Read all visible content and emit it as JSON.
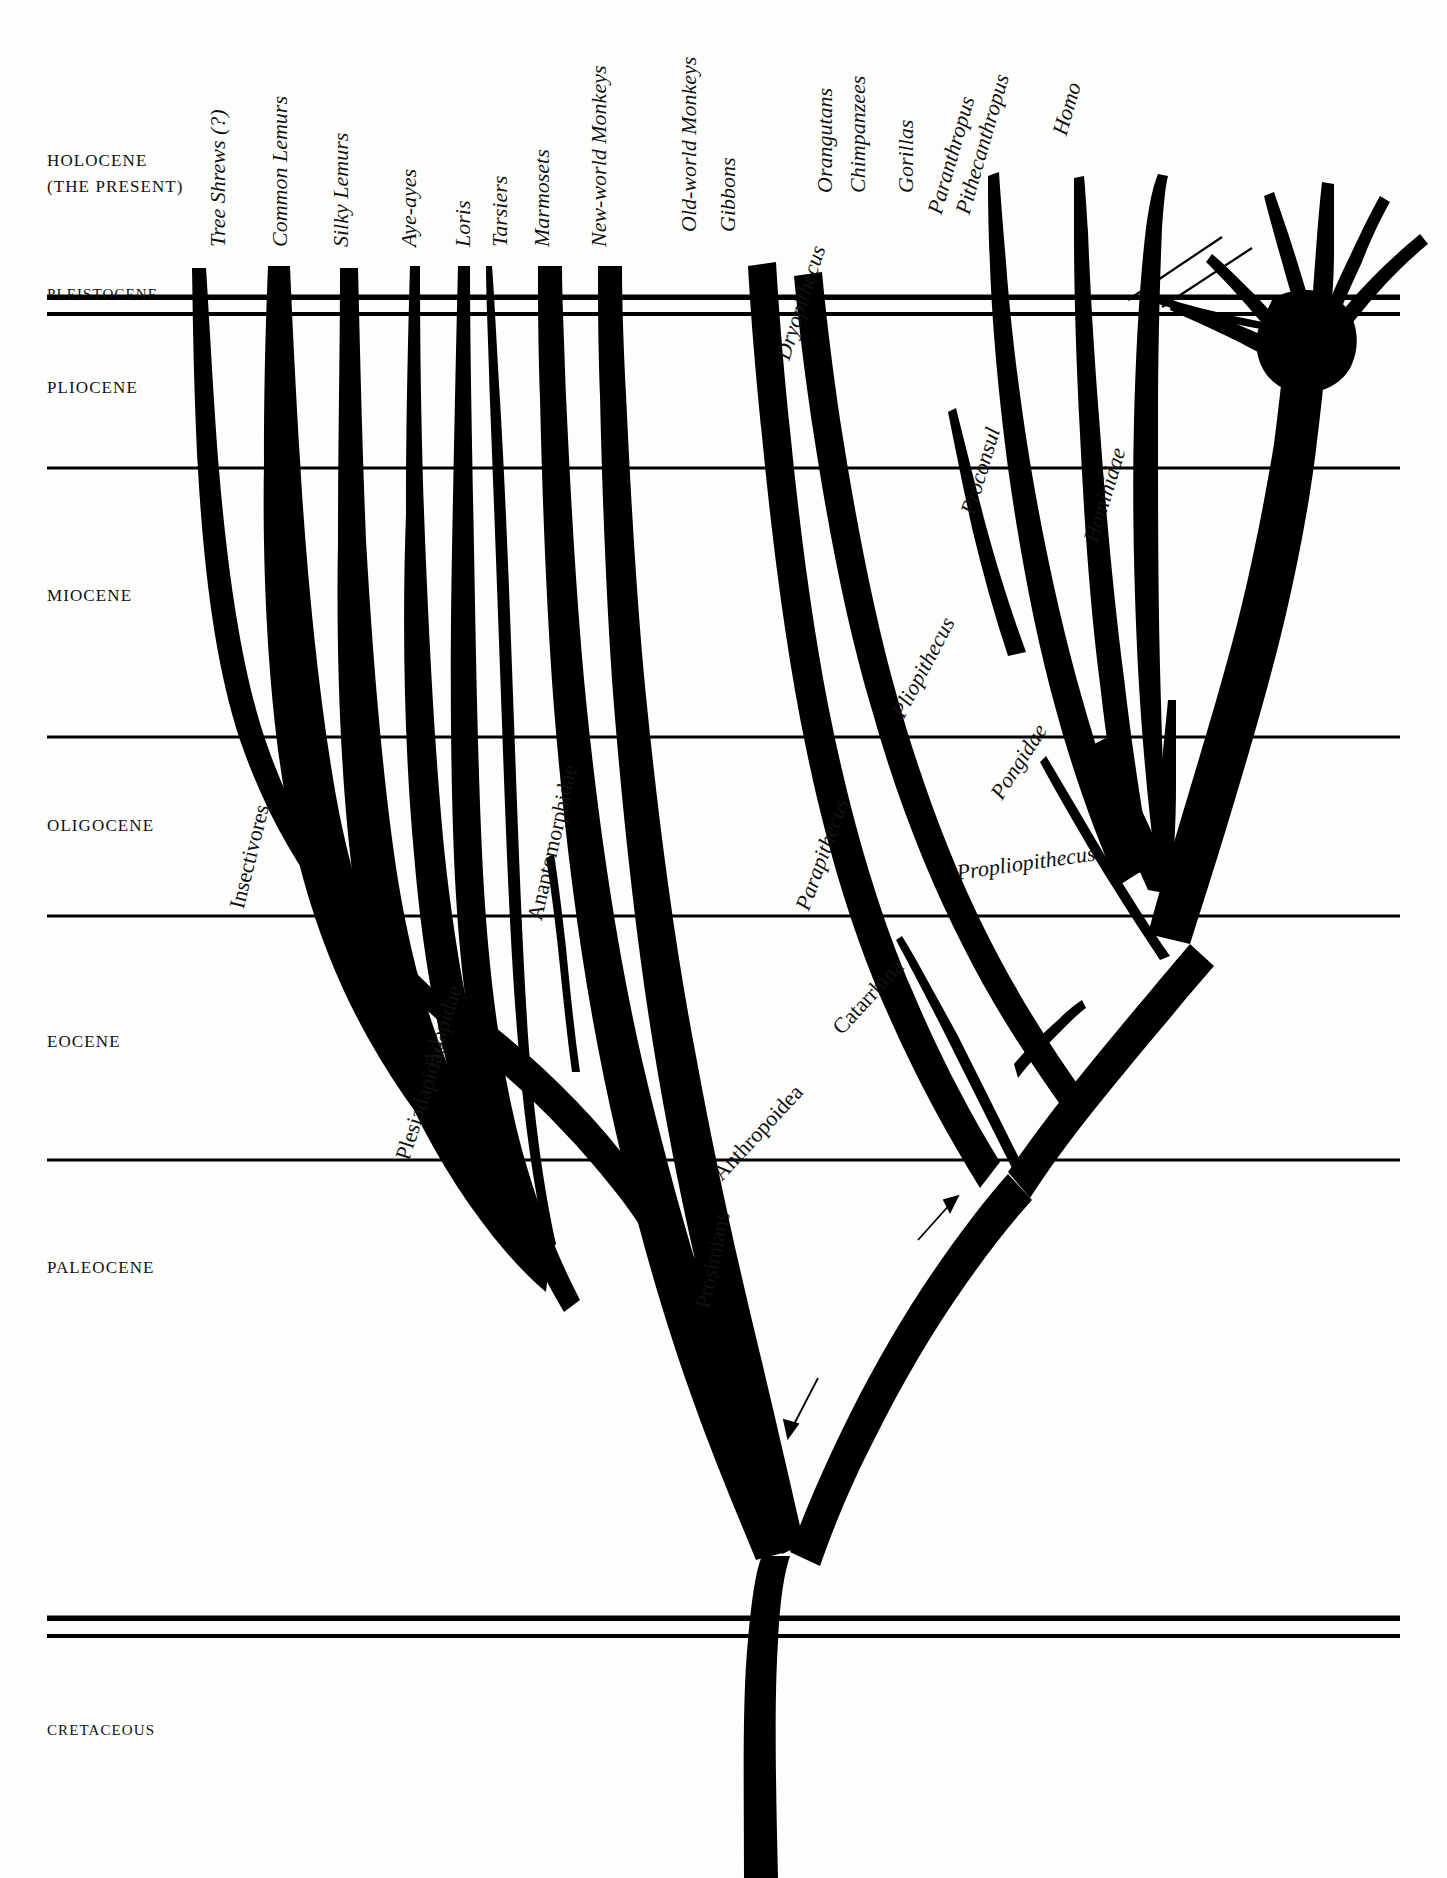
{
  "figure": {
    "kind": "primate-phylogeny-tree",
    "background_color": "#fdfdfc",
    "ink_color": "#000000"
  },
  "time_axis": {
    "epochs": [
      {
        "id": "holocene",
        "label_line1": "HOLOCENE",
        "label_line2": "(THE PRESENT)",
        "label_x": 47,
        "label_y": 155
      },
      {
        "id": "pleistocene",
        "label_line1": "PLEISTOCENE",
        "label_line2": "",
        "label_x": 47,
        "label_y": 286
      },
      {
        "id": "pliocene",
        "label_line1": "PLIOCENE",
        "label_line2": "",
        "label_x": 47,
        "label_y": 378
      },
      {
        "id": "miocene",
        "label_line1": "MIOCENE",
        "label_line2": "",
        "label_x": 47,
        "label_y": 586
      },
      {
        "id": "oligocene",
        "label_line1": "OLIGOCENE",
        "label_line2": "",
        "label_x": 47,
        "label_y": 816
      },
      {
        "id": "eocene",
        "label_line1": "EOCENE",
        "label_line2": "",
        "label_x": 47,
        "label_y": 1032
      },
      {
        "id": "paleocene",
        "label_line1": "PALEOCENE",
        "label_line2": "",
        "label_x": 47,
        "label_y": 1258
      },
      {
        "id": "cretaceous",
        "label_line1": "CRETACEOUS",
        "label_line2": "",
        "label_x": 47,
        "label_y": 1722
      }
    ],
    "boundary_lines": [
      {
        "id": "pleistocene-top",
        "y": 297,
        "thickness": 5.5,
        "x1": 47,
        "x2": 1400
      },
      {
        "id": "pleistocene-bottom",
        "y": 315,
        "thickness": 4.0,
        "x1": 47,
        "x2": 1400
      },
      {
        "id": "pliocene-bottom",
        "y": 468,
        "thickness": 3.0,
        "x1": 47,
        "x2": 1400
      },
      {
        "id": "miocene-bottom",
        "y": 737,
        "thickness": 3.0,
        "x1": 47,
        "x2": 1400
      },
      {
        "id": "oligocene-bottom",
        "y": 916,
        "thickness": 3.0,
        "x1": 47,
        "x2": 1400
      },
      {
        "id": "eocene-bottom",
        "y": 1160,
        "thickness": 3.0,
        "x1": 47,
        "x2": 1400
      },
      {
        "id": "paleocene-bottom-a",
        "y": 1618,
        "thickness": 5.5,
        "x1": 47,
        "x2": 1400
      },
      {
        "id": "paleocene-bottom-b",
        "y": 1637,
        "thickness": 4.0,
        "x1": 47,
        "x2": 1400
      }
    ]
  },
  "tip_labels": [
    {
      "id": "tree-shrews",
      "text": "Tree Shrews (?)",
      "x": 205,
      "y": 247,
      "angle": -90,
      "style": "italic"
    },
    {
      "id": "common-lemurs",
      "text": "Common Lemurs",
      "x": 267,
      "y": 247,
      "angle": -90,
      "style": "italic"
    },
    {
      "id": "silky-lemurs",
      "text": "Silky Lemurs",
      "x": 328,
      "y": 247,
      "angle": -90,
      "style": "italic"
    },
    {
      "id": "aye-ayes",
      "text": "Aye-ayes",
      "x": 396,
      "y": 247,
      "angle": -90,
      "style": "italic"
    },
    {
      "id": "loris",
      "text": "Loris",
      "x": 450,
      "y": 247,
      "angle": -90,
      "style": "italic"
    },
    {
      "id": "tarsiers",
      "text": "Tarsiers",
      "x": 487,
      "y": 247,
      "angle": -90,
      "style": "italic"
    },
    {
      "id": "marmosets",
      "text": "Marmosets",
      "x": 529,
      "y": 247,
      "angle": -90,
      "style": "italic"
    },
    {
      "id": "new-world-monkeys",
      "text": "New-world Monkeys",
      "x": 586,
      "y": 247,
      "angle": -90,
      "style": "italic"
    },
    {
      "id": "old-world-monkeys",
      "text": "Old-world Monkeys",
      "x": 676,
      "y": 232,
      "angle": -90,
      "style": "italic"
    },
    {
      "id": "gibbons",
      "text": "Gibbons",
      "x": 715,
      "y": 232,
      "angle": -90,
      "style": "italic"
    },
    {
      "id": "orangutans",
      "text": "Orangutans",
      "x": 812,
      "y": 193,
      "angle": -90,
      "style": "italic"
    },
    {
      "id": "chimpanzees",
      "text": "Chimpanzees",
      "x": 845,
      "y": 193,
      "angle": -90,
      "style": "italic"
    },
    {
      "id": "gorillas",
      "text": "Gorillas",
      "x": 893,
      "y": 193,
      "angle": -90,
      "style": "italic"
    },
    {
      "id": "paranthropus",
      "text": "Paranthropus",
      "x": 922,
      "y": 210,
      "angle": -74,
      "style": "italic"
    },
    {
      "id": "pithecanthropus",
      "text": "Pithecanthropus",
      "x": 950,
      "y": 210,
      "angle": -74,
      "style": "italic"
    },
    {
      "id": "homo",
      "text": "Homo",
      "x": 1047,
      "y": 131,
      "angle": -74,
      "style": "italic"
    }
  ],
  "inner_labels": [
    {
      "id": "insectivores",
      "text": "Insectivores",
      "x": 224,
      "y": 905,
      "angle": -76,
      "style": "upright"
    },
    {
      "id": "plesiadapidae",
      "text": "Plesiadapidae",
      "x": 390,
      "y": 1155,
      "angle": -72,
      "style": "upright"
    },
    {
      "id": "adapidae",
      "text": "Adapidae",
      "x": 417,
      "y": 1062,
      "angle": -72,
      "style": "upright"
    },
    {
      "id": "anaptomorphidae",
      "text": "Anaptomorphidae",
      "x": 522,
      "y": 917,
      "angle": -77,
      "style": "upright"
    },
    {
      "id": "prosimians",
      "text": "Prosimians",
      "x": 690,
      "y": 1305,
      "angle": -78,
      "style": "upright"
    },
    {
      "id": "anthropoidea",
      "text": "Anthropoidea",
      "x": 707,
      "y": 1168,
      "angle": -47,
      "style": "upright"
    },
    {
      "id": "catarrhina",
      "text": "Catarrhina",
      "x": 827,
      "y": 1022,
      "angle": -47,
      "style": "upright"
    },
    {
      "id": "parapithecus",
      "text": "Parapithecus",
      "x": 790,
      "y": 905,
      "angle": -70,
      "style": "italic"
    },
    {
      "id": "propliopithecus",
      "text": "Propliopithecus",
      "x": 955,
      "y": 860,
      "angle": -8,
      "style": "italic"
    },
    {
      "id": "pliopithecus",
      "text": "Pliopithecus",
      "x": 886,
      "y": 710,
      "angle": -62,
      "style": "italic"
    },
    {
      "id": "proconsul",
      "text": "Proconsul",
      "x": 955,
      "y": 510,
      "angle": -73,
      "style": "italic"
    },
    {
      "id": "dryopithecus",
      "text": "Dryopithecus",
      "x": 770,
      "y": 355,
      "angle": -72,
      "style": "italic"
    },
    {
      "id": "pongidae",
      "text": "Pongidae",
      "x": 985,
      "y": 790,
      "angle": -57,
      "style": "italic"
    },
    {
      "id": "hominidae",
      "text": "Hominidae",
      "x": 1078,
      "y": 538,
      "angle": -73,
      "style": "italic"
    }
  ],
  "leader_lines": [
    {
      "id": "paranthropus-leader",
      "x1": 966,
      "y1": 285,
      "x2": 1072,
      "y2": 213
    },
    {
      "id": "pithecanthropus-leader",
      "x1": 998,
      "y1": 292,
      "x2": 1093,
      "y2": 227
    }
  ],
  "pointer_arrows": [
    {
      "id": "prosimians-arrow",
      "x1": 700,
      "y1": 1180,
      "x2": 668,
      "y2": 1224
    },
    {
      "id": "anthropoidea-arrow",
      "x1": 789,
      "y1": 1060,
      "x2": 818,
      "y2": 1023
    }
  ],
  "branches": [
    {
      "id": "branch-tree-shrews",
      "tip": "Tree Shrews (?)"
    },
    {
      "id": "branch-common-lemurs",
      "tip": "Common Lemurs"
    },
    {
      "id": "branch-silky-lemurs",
      "tip": "Silky Lemurs"
    },
    {
      "id": "branch-aye-ayes",
      "tip": "Aye-ayes"
    },
    {
      "id": "branch-loris",
      "tip": "Loris"
    },
    {
      "id": "branch-tarsiers",
      "tip": "Tarsiers"
    },
    {
      "id": "branch-marmosets",
      "tip": "Marmosets"
    },
    {
      "id": "branch-new-world-monkeys",
      "tip": "New-world Monkeys"
    },
    {
      "id": "branch-old-world-monkeys",
      "tip": "Old-world Monkeys"
    },
    {
      "id": "branch-gibbons",
      "tip": "Gibbons"
    },
    {
      "id": "branch-orangutans",
      "tip": "Orangutans"
    },
    {
      "id": "branch-chimpanzees",
      "tip": "Chimpanzees"
    },
    {
      "id": "branch-gorillas",
      "tip": "Gorillas"
    },
    {
      "id": "branch-homo",
      "tip": "Homo"
    },
    {
      "id": "branch-dryopithecus",
      "tip": "Dryopithecus"
    },
    {
      "id": "branch-proconsul",
      "tip": "Proconsul"
    },
    {
      "id": "branch-pliopithecus",
      "tip": "Pliopithecus"
    },
    {
      "id": "branch-parapithecus",
      "tip": "Parapithecus"
    },
    {
      "id": "branch-propliopithecus",
      "tip": "Propliopithecus"
    },
    {
      "id": "branch-plesiadapidae",
      "tip": "Plesiadapidae"
    },
    {
      "id": "branch-adapidae",
      "tip": "Adapidae"
    },
    {
      "id": "branch-anaptomorphidae",
      "tip": "Anaptomorphidae"
    }
  ]
}
